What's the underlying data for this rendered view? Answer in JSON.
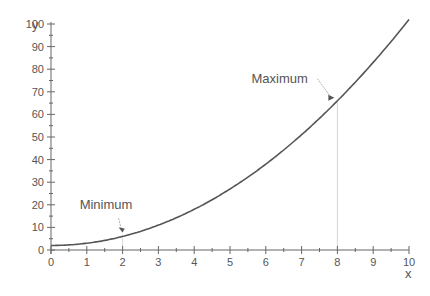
{
  "chart_data": {
    "type": "line",
    "title": "",
    "xlabel": "x",
    "ylabel": "y",
    "xlim": [
      0,
      10
    ],
    "ylim": [
      0,
      100
    ],
    "x_ticks": [
      0,
      1,
      2,
      3,
      4,
      5,
      6,
      7,
      8,
      9,
      10
    ],
    "y_ticks": [
      0,
      10,
      20,
      30,
      40,
      50,
      60,
      70,
      80,
      90,
      100
    ],
    "grid": false,
    "legend": null,
    "series": [
      {
        "name": "y = x^2 + 2",
        "color": "#555555",
        "x": [
          0,
          1,
          2,
          3,
          4,
          5,
          6,
          7,
          8,
          9,
          10
        ],
        "values": [
          2,
          3,
          6,
          11,
          18,
          27,
          38,
          51,
          66,
          83,
          102
        ]
      }
    ],
    "annotations": [
      {
        "text": "Minimum",
        "x": 2,
        "y": 6,
        "text_x": 0.8,
        "text_y": 18
      },
      {
        "text": "Maximum",
        "x": 8,
        "y": 66,
        "text_x": 5.6,
        "text_y": 74,
        "dropline": true
      }
    ]
  },
  "axes": {
    "xlabel": "x",
    "ylabel": "y"
  },
  "annotations": {
    "minimum_label": "Minimum",
    "maximum_label": "Maximum"
  }
}
